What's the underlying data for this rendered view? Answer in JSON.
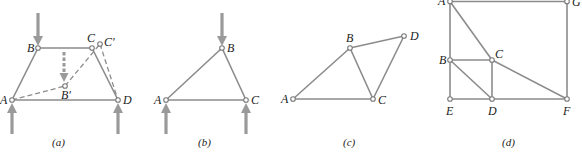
{
  "panels": [
    {
      "id": "a",
      "caption": "(a)",
      "nodes": {
        "A": "A",
        "B": "B",
        "C": "C",
        "D": "D",
        "Bp": "B′",
        "Cp": "C′"
      },
      "members": [
        "AB",
        "BC",
        "CD",
        "AD"
      ],
      "dashed_members": [
        "AB′",
        "B′C′",
        "C′D"
      ],
      "loads": [
        "downward at B",
        "upward at A",
        "upward at D",
        "dashed downward displacement B→B′"
      ]
    },
    {
      "id": "b",
      "caption": "(b)",
      "nodes": {
        "A": "A",
        "B": "B",
        "C": "C"
      },
      "members": [
        "AB",
        "BC",
        "AC"
      ],
      "loads": [
        "downward at B",
        "upward at A",
        "upward at C"
      ]
    },
    {
      "id": "c",
      "caption": "(c)",
      "nodes": {
        "A": "A",
        "B": "B",
        "C": "C",
        "D": "D"
      },
      "members": [
        "AB",
        "AC",
        "BC",
        "BD",
        "CD"
      ]
    },
    {
      "id": "d",
      "caption": "(d)",
      "nodes": {
        "A": "A",
        "B": "B",
        "C": "C",
        "D": "D",
        "E": "E",
        "F": "F",
        "G": "G"
      },
      "members": [
        "AG",
        "GF",
        "AB",
        "BE",
        "ED",
        "DF",
        "AC",
        "CF",
        "BC",
        "CD",
        "BD"
      ]
    }
  ],
  "colors": {
    "member": "#8c8c8c",
    "force_arrow": "#9a9a9a",
    "label": "#222222"
  }
}
